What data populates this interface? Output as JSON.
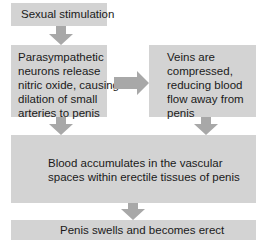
{
  "diagram": {
    "type": "flowchart",
    "colors": {
      "box_fill": "#d3d3d3",
      "arrow_fill": "#a8a8a8",
      "text": "#1a1a1a"
    },
    "nodes": [
      {
        "id": "sexual-stimulation",
        "lines": [
          "Sexual stimulation"
        ]
      },
      {
        "id": "parasympathetic",
        "lines": [
          "Parasympathetic",
          "neurons release",
          "nitric oxide, causing",
          "dilation of small",
          "arteries to penis"
        ]
      },
      {
        "id": "veins-compressed",
        "lines": [
          "Veins are",
          "compressed,",
          "reducing blood",
          "flow away from",
          "penis"
        ]
      },
      {
        "id": "blood-accumulates",
        "lines": [
          "Blood accumulates in the vascular",
          "spaces within erectile tissues of penis"
        ]
      },
      {
        "id": "penis-erect",
        "lines": [
          "Penis swells and becomes erect"
        ]
      }
    ],
    "edges": [
      {
        "from": "sexual-stimulation",
        "to": "parasympathetic",
        "direction": "down"
      },
      {
        "from": "parasympathetic",
        "to": "veins-compressed",
        "direction": "right"
      },
      {
        "from": "parasympathetic",
        "to": "blood-accumulates",
        "direction": "down"
      },
      {
        "from": "veins-compressed",
        "to": "blood-accumulates",
        "direction": "down"
      },
      {
        "from": "blood-accumulates",
        "to": "penis-erect",
        "direction": "down"
      }
    ]
  }
}
